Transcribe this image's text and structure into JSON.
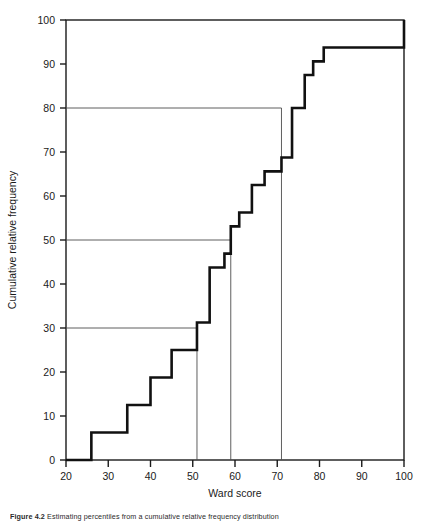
{
  "figure": {
    "caption_label": "Figure 4.2",
    "caption_body": "Estimating percentiles from a cumulative relative frequency distribution"
  },
  "chart_data": {
    "type": "line",
    "subtype": "step-cumulative-ogive",
    "title": "",
    "xlabel": "Ward score",
    "ylabel": "Cumulative relative frequency",
    "xlim": [
      20,
      100
    ],
    "ylim": [
      0,
      100
    ],
    "xticks": [
      20,
      30,
      40,
      50,
      60,
      70,
      80,
      90,
      100
    ],
    "xtick_labels": [
      "20",
      "30",
      "40",
      "50",
      "60",
      "70",
      "80",
      "90",
      "100"
    ],
    "yticks": [
      0,
      10,
      20,
      30,
      40,
      50,
      60,
      70,
      80,
      90,
      100
    ],
    "ytick_labels": [
      "0",
      "10",
      "20",
      "30",
      "40",
      "50",
      "60",
      "70",
      "80",
      "90",
      "100"
    ],
    "grid": false,
    "legend": "none",
    "series": [
      {
        "name": "Cumulative relative frequency",
        "step_type": "post",
        "x": [
          20,
          26,
          34.5,
          40,
          45,
          51,
          54,
          57.5,
          59,
          61,
          64,
          67,
          71,
          73.5,
          76.5,
          78.5,
          81,
          100
        ],
        "y": [
          0,
          6.25,
          12.5,
          18.75,
          25,
          31.25,
          43.75,
          46.9,
          53.1,
          56.25,
          62.5,
          65.6,
          68.75,
          80,
          87.5,
          90.6,
          93.75,
          100
        ]
      }
    ],
    "reference_lines": [
      {
        "name": "p30",
        "percentile": 30,
        "y": 30,
        "x": 51,
        "orientation": "horizontal-then-vertical"
      },
      {
        "name": "p50",
        "percentile": 50,
        "y": 50,
        "x": 59,
        "orientation": "horizontal-then-vertical"
      },
      {
        "name": "p80",
        "percentile": 80,
        "y": 80,
        "x": 71,
        "orientation": "horizontal-then-vertical"
      }
    ],
    "annotations": []
  }
}
